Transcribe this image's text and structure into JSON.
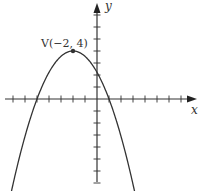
{
  "chart_data": {
    "type": "line",
    "title": "",
    "xlabel": "x",
    "ylabel": "y",
    "grid": false,
    "function": "parabola opening downward with vertex (-2, 4)",
    "vertex": {
      "x": -2,
      "y": 4,
      "label": "V(−2, 4)"
    },
    "x_intercepts": [
      -5,
      1
    ],
    "xlim": [
      -7.5,
      8
    ],
    "ylim": [
      -7,
      7.5
    ],
    "x_ticks": [
      -7,
      -6,
      -5,
      -4,
      -3,
      -2,
      -1,
      1,
      2,
      3,
      4,
      5,
      6,
      7
    ],
    "y_ticks": [
      -7,
      -6,
      -5,
      -4,
      -3,
      -2,
      -1,
      1,
      2,
      3,
      4,
      5,
      6,
      7
    ],
    "series": [
      {
        "name": "parabola",
        "points": [
          [
            -7,
            -7.1
          ],
          [
            -6,
            -3.1
          ],
          [
            -5,
            0
          ],
          [
            -4,
            2.2
          ],
          [
            -3,
            3.6
          ],
          [
            -2,
            4
          ],
          [
            -1,
            3.6
          ],
          [
            0,
            2.2
          ],
          [
            1,
            0
          ],
          [
            2,
            -3.1
          ],
          [
            3,
            -7.1
          ]
        ]
      }
    ]
  },
  "labels": {
    "x_axis": "x",
    "y_axis": "y",
    "vertex": "V(−2, 4)"
  }
}
